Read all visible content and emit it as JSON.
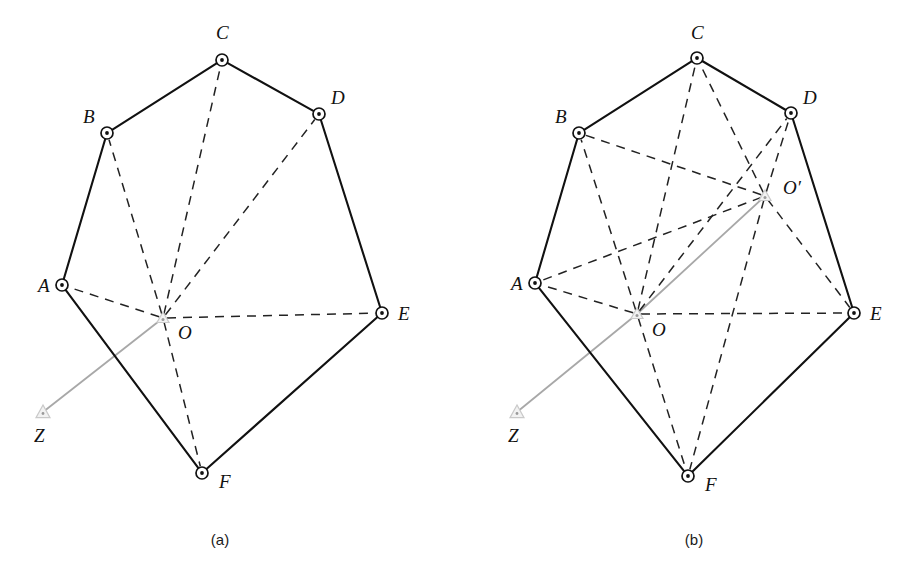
{
  "figure": {
    "background_color": "#ffffff",
    "edge_color": "#111111",
    "dashed_color": "#222222",
    "gray_line_color": "#a8a8a8",
    "marker_fill": "#ffffff"
  },
  "panels": [
    {
      "id": "a",
      "caption": "(a)",
      "caption_pos": {
        "x": 220,
        "y": 545
      },
      "vertices": [
        {
          "name": "A",
          "label": "A",
          "x": 62,
          "y": 285,
          "label_x": 38,
          "label_y": 292
        },
        {
          "name": "B",
          "label": "B",
          "x": 107,
          "y": 133,
          "label_x": 83,
          "label_y": 123
        },
        {
          "name": "C",
          "label": "C",
          "x": 222,
          "y": 60,
          "label_x": 216,
          "label_y": 39
        },
        {
          "name": "D",
          "label": "D",
          "x": 319,
          "y": 114,
          "label_x": 331,
          "label_y": 104
        },
        {
          "name": "E",
          "label": "E",
          "x": 382,
          "y": 313,
          "label_x": 398,
          "label_y": 320
        },
        {
          "name": "F",
          "label": "F",
          "x": 202,
          "y": 473,
          "label_x": 219,
          "label_y": 488
        }
      ],
      "centers": [
        {
          "name": "O",
          "label": "O",
          "x": 163,
          "y": 318,
          "label_x": 178,
          "label_y": 339
        }
      ],
      "anchor": {
        "name": "Z",
        "label": "Z",
        "x": 43,
        "y": 412,
        "label_x": 34,
        "label_y": 442
      },
      "polygon_edges": [
        [
          "A",
          "B"
        ],
        [
          "B",
          "C"
        ],
        [
          "C",
          "D"
        ],
        [
          "D",
          "E"
        ],
        [
          "E",
          "F"
        ],
        [
          "F",
          "A"
        ]
      ],
      "dashed_edges": [
        [
          "O",
          "A"
        ],
        [
          "O",
          "B"
        ],
        [
          "O",
          "C"
        ],
        [
          "O",
          "D"
        ],
        [
          "O",
          "E"
        ],
        [
          "O",
          "F"
        ]
      ],
      "gray_edges": [
        [
          "Z",
          "O"
        ]
      ]
    },
    {
      "id": "b",
      "caption": "(b)",
      "caption_pos": {
        "x": 694,
        "y": 545
      },
      "vertices": [
        {
          "name": "A",
          "label": "A",
          "x": 535,
          "y": 283,
          "label_x": 511,
          "label_y": 290
        },
        {
          "name": "B",
          "label": "B",
          "x": 579,
          "y": 133,
          "label_x": 555,
          "label_y": 123
        },
        {
          "name": "C",
          "label": "C",
          "x": 697,
          "y": 58,
          "label_x": 691,
          "label_y": 39
        },
        {
          "name": "D",
          "label": "D",
          "x": 791,
          "y": 113,
          "label_x": 803,
          "label_y": 104
        },
        {
          "name": "E",
          "label": "E",
          "x": 854,
          "y": 313,
          "label_x": 870,
          "label_y": 320
        },
        {
          "name": "F",
          "label": "F",
          "x": 688,
          "y": 476,
          "label_x": 705,
          "label_y": 491
        }
      ],
      "centers": [
        {
          "name": "O",
          "label": "O",
          "x": 637,
          "y": 314,
          "label_x": 652,
          "label_y": 336
        },
        {
          "name": "O'",
          "label": "O′",
          "x": 765,
          "y": 196,
          "label_x": 783,
          "label_y": 194
        }
      ],
      "anchor": {
        "name": "Z",
        "label": "Z",
        "x": 517,
        "y": 412,
        "label_x": 508,
        "label_y": 442
      },
      "polygon_edges": [
        [
          "A",
          "B"
        ],
        [
          "B",
          "C"
        ],
        [
          "C",
          "D"
        ],
        [
          "D",
          "E"
        ],
        [
          "E",
          "F"
        ],
        [
          "F",
          "A"
        ]
      ],
      "dashed_edges": [
        [
          "O",
          "A"
        ],
        [
          "O",
          "B"
        ],
        [
          "O",
          "C"
        ],
        [
          "O",
          "D"
        ],
        [
          "O",
          "E"
        ],
        [
          "O",
          "F"
        ],
        [
          "O'",
          "A"
        ],
        [
          "O'",
          "B"
        ],
        [
          "O'",
          "C"
        ],
        [
          "O'",
          "D"
        ],
        [
          "O'",
          "E"
        ],
        [
          "O'",
          "F"
        ]
      ],
      "gray_edges": [
        [
          "Z",
          "O"
        ],
        [
          "O",
          "O'"
        ]
      ]
    }
  ]
}
